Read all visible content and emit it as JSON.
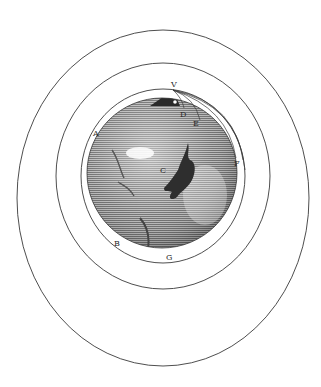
{
  "figure": {
    "stroke_color": "#3a3a3a",
    "globe_fill": "#9a9a9a",
    "labels": [
      {
        "id": "V",
        "text": "V",
        "x": 171,
        "y": 87
      },
      {
        "id": "D",
        "text": "D",
        "x": 180,
        "y": 117
      },
      {
        "id": "E",
        "text": "E",
        "x": 193,
        "y": 126
      },
      {
        "id": "A",
        "text": "A",
        "x": 93,
        "y": 136
      },
      {
        "id": "C",
        "text": "C",
        "x": 160,
        "y": 173
      },
      {
        "id": "F",
        "text": "F",
        "x": 234,
        "y": 166
      },
      {
        "id": "B",
        "text": "B",
        "x": 114,
        "y": 246
      },
      {
        "id": "G",
        "text": "G",
        "x": 166,
        "y": 260
      }
    ],
    "orbits": [
      {
        "name": "outer-orbit",
        "cx": 163,
        "cy": 198,
        "rx": 146,
        "ry": 168
      },
      {
        "name": "middle-orbit",
        "cx": 163,
        "cy": 176,
        "rx": 107,
        "ry": 113
      },
      {
        "name": "inner-orbit",
        "cx": 163,
        "cy": 176,
        "rx": 82,
        "ry": 87
      }
    ],
    "globe": {
      "cx": 162,
      "cy": 173,
      "r": 75
    }
  }
}
